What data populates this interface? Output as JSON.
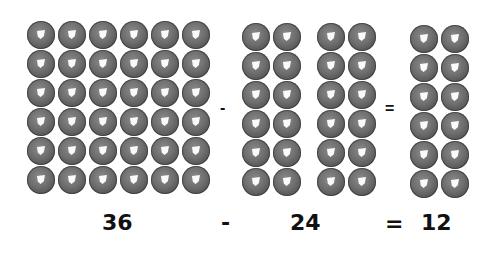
{
  "equation": {
    "minuend": {
      "value": "36",
      "rows": 6,
      "cols": 6
    },
    "subtrahend": {
      "value": "24",
      "groups": [
        {
          "rows": 6,
          "cols": 2
        },
        {
          "rows": 6,
          "cols": 2
        }
      ]
    },
    "difference": {
      "value": "12",
      "rows": 6,
      "cols": 2
    },
    "minus_sign": "-",
    "equals_sign": "="
  },
  "labels": {
    "left_number": "36",
    "middle_number": "24",
    "right_number": "12",
    "row_minus": "-",
    "row_equals": "=",
    "bottom_minus": "-",
    "bottom_equals": "="
  },
  "colors": {
    "ring": "#6e6e6e",
    "ring_edge": "#3e3e3e",
    "background": "#ffffff",
    "text": "#111111"
  }
}
